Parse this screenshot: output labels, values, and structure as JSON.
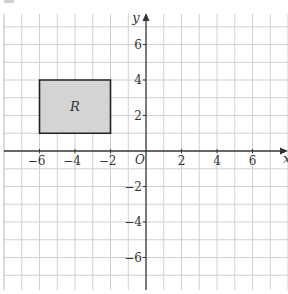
{
  "chart_data": {
    "type": "diagram",
    "title": "",
    "xlabel": "x",
    "ylabel": "y",
    "origin_label": "O",
    "xlim": [
      -8,
      8
    ],
    "ylim": [
      -8,
      8
    ],
    "grid": true,
    "x_tick_labels": [
      {
        "value": -6,
        "label": "−6"
      },
      {
        "value": -4,
        "label": "−4"
      },
      {
        "value": -2,
        "label": "−2"
      },
      {
        "value": 2,
        "label": "2"
      },
      {
        "value": 4,
        "label": "4"
      },
      {
        "value": 6,
        "label": "6"
      }
    ],
    "y_tick_labels": [
      {
        "value": 6,
        "label": "6"
      },
      {
        "value": 4,
        "label": "4"
      },
      {
        "value": 2,
        "label": "2"
      },
      {
        "value": -2,
        "label": "−2"
      },
      {
        "value": -4,
        "label": "−4"
      },
      {
        "value": -6,
        "label": "−6"
      }
    ],
    "shapes": [
      {
        "name": "R",
        "label": "R",
        "type": "rectangle",
        "vertices": [
          [
            -6,
            1
          ],
          [
            -2,
            1
          ],
          [
            -2,
            4
          ],
          [
            -6,
            4
          ]
        ],
        "fill": "#d4d4d4",
        "stroke": "#222222"
      }
    ]
  },
  "style": {
    "grid_color": "#d0d0d0",
    "axis_color": "#333333",
    "text_color": "#333333"
  }
}
